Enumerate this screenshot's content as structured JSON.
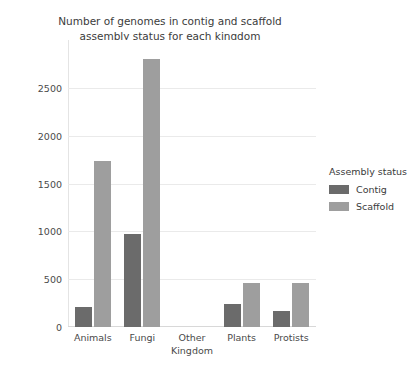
{
  "chart_data": {
    "type": "bar",
    "title": "Number of genomes in contig and scaffold\nassembly status for each kingdom",
    "xlabel": "Kingdom",
    "ylabel": "Genome count",
    "categories": [
      "Animals",
      "Fungi",
      "Other",
      "Plants",
      "Protists"
    ],
    "series": [
      {
        "name": "Contig",
        "color": "#6b6b6b",
        "values": [
          210,
          977,
          0,
          245,
          170
        ]
      },
      {
        "name": "Scaffold",
        "color": "#9e9e9e",
        "values": [
          1733,
          2800,
          0,
          455,
          465
        ]
      }
    ],
    "legend_title": "Assembly status",
    "legend_position": "right",
    "grid": true,
    "ylim": [
      0,
      3000
    ],
    "yticks": [
      0,
      500,
      1000,
      1500,
      2000,
      2500
    ],
    "ytick_labels": [
      "0",
      "500",
      "1000",
      "1500",
      "2000",
      "2500"
    ]
  }
}
